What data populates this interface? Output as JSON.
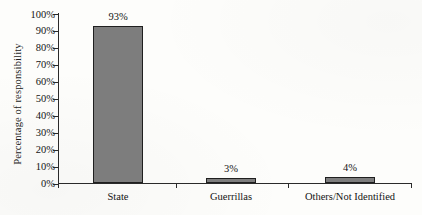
{
  "chart_data": {
    "type": "bar",
    "title": "",
    "xlabel": "",
    "ylabel": "Percentage of responsibility",
    "categories": [
      "State",
      "Guerrillas",
      "Others/Not Identified"
    ],
    "values": [
      93,
      3,
      4
    ],
    "value_labels": [
      "93%",
      "3%",
      "4%"
    ],
    "ylim": [
      0,
      100
    ],
    "ytick_values": [
      0,
      10,
      20,
      30,
      40,
      50,
      60,
      70,
      80,
      90,
      100
    ],
    "ytick_labels": [
      "0%",
      "10%",
      "20%",
      "30%",
      "40%",
      "50%",
      "60%",
      "70%",
      "80%",
      "90%",
      "100%"
    ],
    "grid": false,
    "legend": "none",
    "bar_fill_color": "#7d7d7d",
    "bar_border_color": "#1f1f1f",
    "axis_color": "#2a2a2a",
    "background_color": "#fdfdfb",
    "text_color": "#141414"
  }
}
